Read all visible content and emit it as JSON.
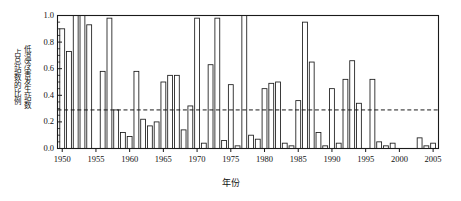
{
  "chart_data": {
    "type": "bar",
    "title": "",
    "xlabel": "年份",
    "ylabel": "低温冷害发生站数占总站数的比例",
    "ylabel_lines": [
      "低温冷害发生站数",
      "占总站数的比例"
    ],
    "xlim": [
      1949.3,
      2005.8
    ],
    "ylim": [
      0.0,
      1.0
    ],
    "grid": false,
    "legend": null,
    "yticks": [
      0.0,
      0.2,
      0.4,
      0.6,
      0.8,
      1.0
    ],
    "ytick_labels": [
      "0.0",
      "0.2",
      "0.4",
      "0.6",
      "0.8",
      "1.0"
    ],
    "y_minor_tick_step": 0.05,
    "xticks": [
      1950,
      1955,
      1960,
      1965,
      1970,
      1975,
      1980,
      1985,
      1990,
      1995,
      2000,
      2005
    ],
    "xtick_labels": [
      "1950",
      "1955",
      "1960",
      "1965",
      "1970",
      "1975",
      "1980",
      "1985",
      "1990",
      "1995",
      "2000",
      "2005"
    ],
    "x_minor_tick_step": 1,
    "bar_fill": "#ffffff",
    "bar_edge": "#1a1a1a",
    "axis_color": "#1a1a1a",
    "reference_line": {
      "value": 0.29,
      "style": "dashed",
      "color": "#1a1a1a",
      "label": ""
    },
    "categories": [
      1950,
      1951,
      1952,
      1953,
      1954,
      1955,
      1956,
      1957,
      1958,
      1959,
      1960,
      1961,
      1962,
      1963,
      1964,
      1965,
      1966,
      1967,
      1968,
      1969,
      1970,
      1971,
      1972,
      1973,
      1974,
      1975,
      1976,
      1977,
      1978,
      1979,
      1980,
      1981,
      1982,
      1983,
      1984,
      1985,
      1986,
      1987,
      1988,
      1989,
      1990,
      1991,
      1992,
      1993,
      1994,
      1995,
      1996,
      1997,
      1998,
      1999,
      2000,
      2001,
      2002,
      2003,
      2004,
      2005
    ],
    "values": [
      0.9,
      0.73,
      1.0,
      1.0,
      0.93,
      0.0,
      0.58,
      0.98,
      0.29,
      0.12,
      0.09,
      0.58,
      0.22,
      0.17,
      0.2,
      0.5,
      0.55,
      0.55,
      0.14,
      0.32,
      0.98,
      0.04,
      0.63,
      0.98,
      0.06,
      0.48,
      0.02,
      1.0,
      0.1,
      0.07,
      0.45,
      0.49,
      0.5,
      0.04,
      0.02,
      0.36,
      0.95,
      0.65,
      0.12,
      0.02,
      0.45,
      0.04,
      0.52,
      0.66,
      0.34,
      0.0,
      0.52,
      0.05,
      0.02,
      0.04,
      0.0,
      0.0,
      0.0,
      0.08,
      0.02,
      0.04
    ]
  }
}
